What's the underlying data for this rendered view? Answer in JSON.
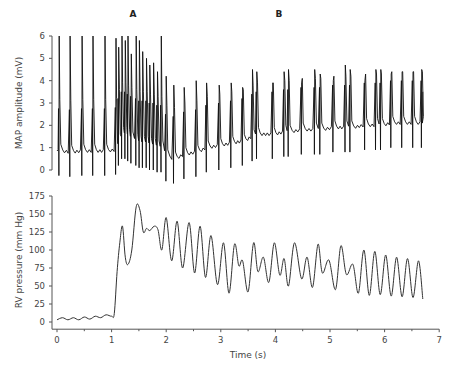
{
  "chart_data": [
    {
      "type": "line",
      "panel": "top",
      "title": "",
      "xlabel": "",
      "ylabel": "MAP amplitude (mV)",
      "ylim": [
        0,
        6
      ],
      "yticks": [
        0,
        1,
        2,
        3,
        4,
        5,
        6
      ],
      "xlim": [
        0,
        7
      ],
      "grid": false,
      "annotations": [
        {
          "text": "A",
          "x": 1.35
        },
        {
          "text": "B",
          "x": 3.65
        }
      ],
      "series": [
        {
          "name": "MAP",
          "beats": [
            {
              "t": 0.04,
              "peak": 6.0,
              "base": 0.85
            },
            {
              "t": 0.24,
              "peak": 6.0,
              "base": 0.8
            },
            {
              "t": 0.46,
              "peak": 6.0,
              "base": 0.85
            },
            {
              "t": 0.66,
              "peak": 6.0,
              "base": 0.85
            },
            {
              "t": 0.88,
              "peak": 6.0,
              "base": 0.85
            },
            {
              "t": 1.08,
              "peak": 5.9,
              "base": 0.9
            },
            {
              "t": 1.13,
              "peak": 5.5,
              "base": 1.3
            },
            {
              "t": 1.19,
              "peak": 6.0,
              "base": 1.6
            },
            {
              "t": 1.25,
              "peak": 5.8,
              "base": 1.6
            },
            {
              "t": 1.3,
              "peak": 6.0,
              "base": 1.5
            },
            {
              "t": 1.36,
              "peak": 5.2,
              "base": 1.4
            },
            {
              "t": 1.45,
              "peak": 6.0,
              "base": 1.3
            },
            {
              "t": 1.51,
              "peak": 5.8,
              "base": 1.2
            },
            {
              "t": 1.57,
              "peak": 5.3,
              "base": 1.2
            },
            {
              "t": 1.64,
              "peak": 5.0,
              "base": 1.2
            },
            {
              "t": 1.7,
              "peak": 4.7,
              "base": 1.1
            },
            {
              "t": 1.77,
              "peak": 4.8,
              "base": 1.1
            },
            {
              "t": 1.84,
              "peak": 4.4,
              "base": 1.0
            },
            {
              "t": 1.91,
              "peak": 6.0,
              "base": 1.0
            },
            {
              "t": 2.0,
              "peak": 4.2,
              "base": 0.6
            },
            {
              "t": 2.14,
              "peak": 3.8,
              "base": 0.5
            },
            {
              "t": 2.33,
              "peak": 3.7,
              "base": 0.7
            },
            {
              "t": 2.55,
              "peak": 4.0,
              "base": 0.8
            },
            {
              "t": 2.74,
              "peak": 3.9,
              "base": 1.0
            },
            {
              "t": 2.97,
              "peak": 3.8,
              "base": 1.1
            },
            {
              "t": 3.19,
              "peak": 3.9,
              "base": 1.2
            },
            {
              "t": 3.4,
              "peak": 3.7,
              "base": 1.3
            },
            {
              "t": 3.58,
              "peak": 4.5,
              "base": 1.5
            },
            {
              "t": 3.66,
              "peak": 4.4,
              "base": 1.6
            },
            {
              "t": 3.95,
              "peak": 3.9,
              "base": 1.6
            },
            {
              "t": 4.16,
              "peak": 4.4,
              "base": 1.7
            },
            {
              "t": 4.24,
              "peak": 4.5,
              "base": 1.7
            },
            {
              "t": 4.48,
              "peak": 3.9,
              "base": 1.8
            },
            {
              "t": 4.72,
              "peak": 4.5,
              "base": 1.8
            },
            {
              "t": 4.82,
              "peak": 4.3,
              "base": 1.8
            },
            {
              "t": 5.06,
              "peak": 4.0,
              "base": 1.9
            },
            {
              "t": 5.28,
              "peak": 4.7,
              "base": 1.9
            },
            {
              "t": 5.37,
              "peak": 4.5,
              "base": 1.9
            },
            {
              "t": 5.64,
              "peak": 4.0,
              "base": 2.0
            },
            {
              "t": 5.84,
              "peak": 4.5,
              "base": 2.0
            },
            {
              "t": 5.93,
              "peak": 4.5,
              "base": 2.0
            },
            {
              "t": 6.12,
              "peak": 4.3,
              "base": 2.1
            },
            {
              "t": 6.32,
              "peak": 4.4,
              "base": 2.1
            },
            {
              "t": 6.52,
              "peak": 4.4,
              "base": 2.1
            },
            {
              "t": 6.68,
              "peak": 4.5,
              "base": 2.1
            }
          ],
          "end_t": 6.7,
          "end_value": 3.5
        }
      ]
    },
    {
      "type": "line",
      "panel": "bottom",
      "title": "",
      "xlabel": "Time (s)",
      "ylabel": "RV pressure (mm Hg)",
      "ylim": [
        -10,
        175
      ],
      "yticks": [
        0,
        25,
        50,
        75,
        100,
        125,
        150,
        175
      ],
      "xlim": [
        0,
        7
      ],
      "xticks": [
        0,
        1,
        2,
        3,
        4,
        5,
        6,
        7
      ],
      "grid": false,
      "series": [
        {
          "name": "RV pressure",
          "x": [
            0.0,
            0.1,
            0.2,
            0.3,
            0.4,
            0.5,
            0.6,
            0.7,
            0.8,
            0.9,
            1.0,
            1.05,
            1.1,
            1.15,
            1.2,
            1.25,
            1.3,
            1.37,
            1.45,
            1.52,
            1.58,
            1.64,
            1.7,
            1.78,
            1.85,
            1.92,
            2.0,
            2.1,
            2.2,
            2.3,
            2.42,
            2.52,
            2.62,
            2.72,
            2.82,
            2.94,
            3.05,
            3.15,
            3.25,
            3.33,
            3.4,
            3.5,
            3.6,
            3.68,
            3.78,
            3.88,
            3.98,
            4.08,
            4.16,
            4.24,
            4.35,
            4.48,
            4.58,
            4.68,
            4.78,
            4.86,
            4.98,
            5.1,
            5.2,
            5.3,
            5.42,
            5.52,
            5.62,
            5.72,
            5.82,
            5.92,
            6.02,
            6.12,
            6.22,
            6.32,
            6.42,
            6.52,
            6.62,
            6.7
          ],
          "y": [
            3,
            6,
            3,
            6,
            3,
            7,
            4,
            8,
            6,
            10,
            8,
            12,
            70,
            110,
            133,
            90,
            80,
            100,
            160,
            155,
            125,
            130,
            127,
            133,
            128,
            100,
            145,
            85,
            140,
            75,
            138,
            68,
            133,
            62,
            120,
            52,
            110,
            40,
            108,
            78,
            85,
            42,
            110,
            70,
            90,
            55,
            110,
            65,
            88,
            50,
            110,
            60,
            90,
            48,
            108,
            68,
            86,
            45,
            106,
            66,
            80,
            40,
            100,
            37,
            98,
            38,
            93,
            36,
            90,
            35,
            88,
            34,
            85,
            32
          ]
        }
      ]
    }
  ],
  "labels": {
    "panel_a": "A",
    "panel_b": "B",
    "top_ylabel": "MAP amplitude (mV)",
    "bottom_ylabel": "RV pressure (mm Hg)",
    "xlabel": "Time (s)"
  }
}
